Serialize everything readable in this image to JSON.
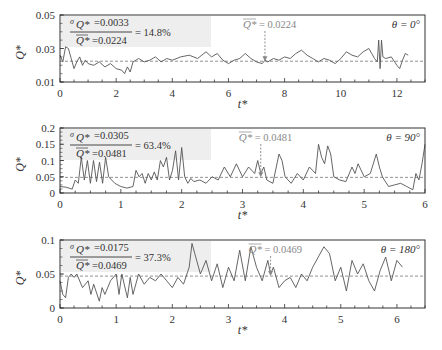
{
  "figure": {
    "line_color": "#555555",
    "mean_line_color": "#777777",
    "frame_color": "#333333",
    "annot_box_color": "#eeeeee",
    "mean_label_color": "#888888"
  },
  "chart_data": [
    {
      "type": "line",
      "panel": "theta-0",
      "theta_label": "θ = 0°",
      "xlabel": "t*",
      "ylabel": "Q*",
      "xlim": [
        0,
        13
      ],
      "ylim": [
        0.01,
        0.05
      ],
      "xticks": [
        0,
        2,
        4,
        6,
        8,
        10,
        12
      ],
      "xtick_labels": [
        "0",
        "2",
        "4",
        "6",
        "8",
        "10",
        "12"
      ],
      "yticks": [
        0.01,
        0.03,
        0.05
      ],
      "ytick_labels": [
        "0.01",
        "0.03",
        "0.05"
      ],
      "mean": 0.0224,
      "mean_label": "= 0.0224",
      "mean_arrow_t": 7.3,
      "annotation": {
        "sigma": "=0.0033",
        "mean": "=0.0224",
        "ratio": "= 14.8%"
      },
      "frame": {
        "x0": 60,
        "x1": 425,
        "y0": 15,
        "y1": 82
      },
      "x": [
        0,
        0.1,
        0.2,
        0.3,
        0.4,
        0.5,
        0.6,
        0.7,
        0.8,
        0.9,
        1.0,
        1.2,
        1.4,
        1.6,
        1.8,
        2.0,
        2.2,
        2.3,
        2.4,
        2.5,
        2.6,
        2.8,
        3.0,
        3.2,
        3.4,
        3.6,
        3.8,
        4.0,
        4.3,
        4.6,
        4.9,
        5.2,
        5.4,
        5.6,
        5.8,
        6.0,
        6.2,
        6.4,
        6.6,
        6.8,
        7.0,
        7.2,
        7.3,
        7.4,
        7.6,
        7.8,
        8.0,
        8.2,
        8.4,
        8.6,
        8.8,
        9.0,
        9.2,
        9.4,
        9.6,
        9.8,
        10.0,
        10.2,
        10.4,
        10.6,
        10.8,
        11.0,
        11.1,
        11.2,
        11.3,
        11.35,
        11.4,
        11.45,
        11.5,
        11.6,
        11.8,
        12.0,
        12.1,
        12.2,
        12.3,
        12.4
      ],
      "values": [
        0.026,
        0.022,
        0.031,
        0.03,
        0.024,
        0.018,
        0.022,
        0.025,
        0.02,
        0.023,
        0.021,
        0.02,
        0.022,
        0.019,
        0.021,
        0.018,
        0.017,
        0.015,
        0.019,
        0.016,
        0.022,
        0.024,
        0.022,
        0.023,
        0.025,
        0.022,
        0.024,
        0.023,
        0.025,
        0.026,
        0.024,
        0.028,
        0.025,
        0.027,
        0.023,
        0.021,
        0.023,
        0.024,
        0.027,
        0.024,
        0.022,
        0.021,
        0.023,
        0.022,
        0.024,
        0.023,
        0.025,
        0.024,
        0.027,
        0.029,
        0.026,
        0.024,
        0.022,
        0.024,
        0.023,
        0.021,
        0.024,
        0.028,
        0.026,
        0.025,
        0.028,
        0.03,
        0.027,
        0.024,
        0.022,
        0.035,
        0.018,
        0.035,
        0.025,
        0.024,
        0.025,
        0.02,
        0.018,
        0.023,
        0.027,
        0.026
      ]
    },
    {
      "type": "line",
      "panel": "theta-90",
      "theta_label": "θ = 90°",
      "xlabel": "t*",
      "ylabel": "Q*",
      "xlim": [
        0,
        6
      ],
      "ylim": [
        0,
        0.2
      ],
      "xticks": [
        0,
        1,
        2,
        3,
        4,
        5,
        6
      ],
      "xtick_labels": [
        "0",
        "1",
        "2",
        "3",
        "4",
        "5",
        "6"
      ],
      "yticks": [
        0,
        0.05,
        0.1,
        0.15,
        0.2
      ],
      "ytick_labels": [
        "0",
        "0.05",
        "0.1",
        "0.15",
        "0.2"
      ],
      "mean": 0.0481,
      "mean_label": "= 0.0481",
      "mean_arrow_t": 3.3,
      "annotation": {
        "sigma": "=0.0305",
        "mean": "=0.0481",
        "ratio": "= 63.4%"
      },
      "frame": {
        "x0": 60,
        "x1": 425,
        "y0": 128,
        "y1": 193
      },
      "x": [
        0,
        0.1,
        0.2,
        0.25,
        0.3,
        0.35,
        0.4,
        0.45,
        0.5,
        0.55,
        0.6,
        0.65,
        0.7,
        0.75,
        0.8,
        0.85,
        0.9,
        1.0,
        1.1,
        1.2,
        1.25,
        1.3,
        1.35,
        1.4,
        1.45,
        1.5,
        1.55,
        1.6,
        1.65,
        1.7,
        1.75,
        1.8,
        1.85,
        1.9,
        1.95,
        2.0,
        2.05,
        2.1,
        2.15,
        2.2,
        2.3,
        2.4,
        2.5,
        2.6,
        2.7,
        2.8,
        2.9,
        3.0,
        3.1,
        3.2,
        3.25,
        3.3,
        3.35,
        3.4,
        3.5,
        3.6,
        3.65,
        3.7,
        3.8,
        3.9,
        4.0,
        4.1,
        4.2,
        4.25,
        4.3,
        4.35,
        4.4,
        4.45,
        4.5,
        4.6,
        4.7,
        4.8,
        4.85,
        4.9,
        5.0,
        5.1,
        5.2,
        5.25,
        5.3,
        5.4,
        5.5,
        5.6,
        5.7,
        5.8,
        5.85,
        5.9,
        5.95,
        6.0
      ],
      "values": [
        0.02,
        0.018,
        0.012,
        0.04,
        0.03,
        0.11,
        0.04,
        0.1,
        0.03,
        0.1,
        0.035,
        0.095,
        0.03,
        0.11,
        0.05,
        0.04,
        0.03,
        0.02,
        0.015,
        0.02,
        0.07,
        0.05,
        0.06,
        0.03,
        0.06,
        0.04,
        0.065,
        0.04,
        0.1,
        0.08,
        0.11,
        0.04,
        0.07,
        0.13,
        0.04,
        0.14,
        0.05,
        0.03,
        0.045,
        0.035,
        0.04,
        0.03,
        0.05,
        0.04,
        0.08,
        0.05,
        0.09,
        0.05,
        0.08,
        0.06,
        0.1,
        0.06,
        0.08,
        0.04,
        0.03,
        0.12,
        0.1,
        0.05,
        0.03,
        0.06,
        0.04,
        0.08,
        0.06,
        0.15,
        0.11,
        0.09,
        0.145,
        0.12,
        0.05,
        0.04,
        0.035,
        0.08,
        0.06,
        0.09,
        0.05,
        0.06,
        0.12,
        0.08,
        0.05,
        0.02,
        0.025,
        0.03,
        0.02,
        0.01,
        0.06,
        0.04,
        0.09,
        0.15
      ]
    },
    {
      "type": "line",
      "panel": "theta-180",
      "theta_label": "θ = 180°",
      "xlabel": "t*",
      "ylabel": "Q*",
      "xlim": [
        0,
        6.5
      ],
      "ylim": [
        0,
        0.1
      ],
      "xticks": [
        0,
        1,
        2,
        3,
        4,
        5,
        6
      ],
      "xtick_labels": [
        "0",
        "1",
        "2",
        "3",
        "4",
        "5",
        "6"
      ],
      "yticks": [
        0,
        0.05,
        0.1
      ],
      "ytick_labels": [
        "0",
        "0.05",
        "0.1"
      ],
      "mean": 0.0469,
      "mean_label": "= 0.0469",
      "mean_arrow_t": 3.75,
      "annotation": {
        "sigma": "=0.0175",
        "mean": "=0.0469",
        "ratio": "= 37.3%"
      },
      "frame": {
        "x0": 60,
        "x1": 425,
        "y0": 240,
        "y1": 308
      },
      "x": [
        0,
        0.05,
        0.1,
        0.15,
        0.2,
        0.25,
        0.3,
        0.4,
        0.5,
        0.55,
        0.6,
        0.7,
        0.75,
        0.8,
        0.9,
        1.0,
        1.05,
        1.1,
        1.2,
        1.25,
        1.3,
        1.4,
        1.5,
        1.6,
        1.7,
        1.8,
        1.9,
        2.0,
        2.1,
        2.2,
        2.3,
        2.35,
        2.4,
        2.5,
        2.6,
        2.7,
        2.8,
        2.9,
        3.0,
        3.1,
        3.2,
        3.3,
        3.4,
        3.5,
        3.6,
        3.7,
        3.75,
        3.8,
        3.9,
        4.0,
        4.1,
        4.2,
        4.3,
        4.4,
        4.5,
        4.6,
        4.7,
        4.8,
        4.9,
        5.0,
        5.1,
        5.2,
        5.3,
        5.4,
        5.5,
        5.6,
        5.7,
        5.8,
        5.9,
        6.0,
        6.1
      ],
      "values": [
        0.04,
        0.02,
        0.015,
        0.045,
        0.05,
        0.045,
        0.05,
        0.03,
        0.04,
        0.02,
        0.035,
        0.01,
        0.03,
        0.02,
        0.04,
        0.05,
        0.02,
        0.05,
        0.015,
        0.045,
        0.02,
        0.05,
        0.035,
        0.045,
        0.04,
        0.05,
        0.04,
        0.03,
        0.045,
        0.035,
        0.06,
        0.095,
        0.08,
        0.05,
        0.07,
        0.04,
        0.065,
        0.03,
        0.06,
        0.04,
        0.085,
        0.04,
        0.09,
        0.06,
        0.04,
        0.07,
        0.05,
        0.06,
        0.03,
        0.04,
        0.045,
        0.03,
        0.05,
        0.04,
        0.06,
        0.075,
        0.09,
        0.08,
        0.04,
        0.06,
        0.025,
        0.07,
        0.05,
        0.065,
        0.04,
        0.025,
        0.055,
        0.075,
        0.04,
        0.07,
        0.06
      ]
    }
  ]
}
